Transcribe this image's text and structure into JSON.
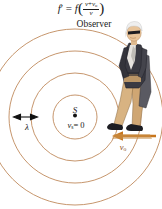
{
  "diagram": {
    "formula": {
      "lhs_symbol": "f",
      "prime": "′",
      "equals": "=",
      "rhs_symbol": "f",
      "open_paren": "(",
      "close_paren": ")",
      "numerator_v": "v",
      "numerator_plus": "+",
      "numerator_vo": "v",
      "numerator_vo_sub": "o",
      "denominator": "v",
      "plain_text": "f ′ = f ( (v + v₀) / v )"
    },
    "observer_label": "Observer",
    "source": {
      "name_label": "S",
      "velocity_label": "v",
      "velocity_sub": "s",
      "velocity_equals": "= 0",
      "velocity_plain": "vₛ = 0",
      "center_x": 75,
      "center_y": 117
    },
    "wavelength": {
      "label": "λ",
      "arrow_type": "double-headed",
      "arrow_x1": 15,
      "arrow_x2": 36,
      "arrow_y": 117
    },
    "observer_velocity": {
      "label": "v",
      "sub": "o",
      "plain": "vₒ",
      "direction": "left",
      "arrow_x1": 155,
      "arrow_x2": 113,
      "arrow_y": 136
    },
    "wavefronts": {
      "count": 4,
      "radii": [
        22,
        44,
        66,
        88
      ],
      "center_x": 75,
      "center_y": 117,
      "stroke_color": "#c08a5c",
      "stroke_width": 0.9
    },
    "colors": {
      "wavefront": "#c08a5c",
      "arrow_observer_velocity": "#c8761c",
      "arrow_wavelength": "#111111",
      "text": "#1a1a1a",
      "background": "#ffffff",
      "jacket": "#3a3a42",
      "pants": "#c9a06a",
      "hair": "#efefef",
      "skin": "#e8c49a",
      "shoes": "#1d1d22",
      "ground": "#c08a5c"
    },
    "figure": {
      "name": "walking-observer-person",
      "description": "man with white hair and dark sunglasses wearing a dark jacket and tan trousers, walking to the left"
    }
  }
}
